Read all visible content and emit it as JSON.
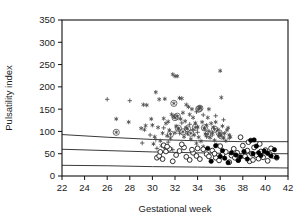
{
  "chart_data": {
    "type": "scatter",
    "title": "",
    "subtitle": "",
    "xlabel": "Gestational week",
    "ylabel": "Pulsatility index",
    "xlim": [
      22,
      42
    ],
    "ylim": [
      0,
      350
    ],
    "xticks": [
      22,
      24,
      26,
      28,
      30,
      32,
      34,
      36,
      38,
      40,
      42
    ],
    "yticks": [
      0,
      50,
      100,
      150,
      200,
      250,
      300,
      350
    ],
    "grid": false,
    "legend_position": "none",
    "background_color": "#ffffff",
    "axis_color": "#111111",
    "marker_color": "#4a4a4a",
    "curve_color": "#3a3a3a",
    "annotations": [],
    "series": [
      {
        "name": "asterisk",
        "marker": "asterisk",
        "points": [
          [
            26.8,
            128
          ],
          [
            27.9,
            121
          ],
          [
            29.2,
            160
          ],
          [
            29.5,
            159
          ],
          [
            29.9,
            128
          ],
          [
            30.3,
            188
          ],
          [
            30.6,
            172
          ],
          [
            31.1,
            173
          ],
          [
            31.4,
            122
          ],
          [
            31.8,
            228
          ],
          [
            32.0,
            224
          ],
          [
            32.2,
            224
          ],
          [
            32.4,
            175
          ],
          [
            32.6,
            174
          ],
          [
            33.2,
            155
          ],
          [
            33.5,
            150
          ],
          [
            34.2,
            154
          ],
          [
            35.0,
            150
          ],
          [
            36.0,
            236
          ],
          [
            36.1,
            176
          ],
          [
            29.0,
            107
          ],
          [
            29.3,
            104
          ],
          [
            29.4,
            113
          ],
          [
            30.0,
            114
          ],
          [
            30.5,
            109
          ],
          [
            30.9,
            96
          ],
          [
            31.0,
            129
          ],
          [
            31.2,
            118
          ],
          [
            31.5,
            103
          ],
          [
            31.7,
            138
          ],
          [
            31.9,
            133
          ],
          [
            32.1,
            112
          ],
          [
            32.3,
            105
          ],
          [
            32.5,
            128
          ],
          [
            32.7,
            142
          ],
          [
            32.9,
            123
          ],
          [
            33.0,
            108
          ],
          [
            33.3,
            138
          ],
          [
            33.6,
            131
          ],
          [
            33.8,
            119
          ],
          [
            34.0,
            110
          ],
          [
            34.4,
            121
          ],
          [
            34.6,
            106
          ],
          [
            34.8,
            114
          ],
          [
            35.2,
            118
          ],
          [
            35.4,
            109
          ],
          [
            35.6,
            121
          ],
          [
            35.8,
            104
          ],
          [
            36.2,
            112
          ],
          [
            36.4,
            96
          ],
          [
            36.6,
            103
          ],
          [
            36.8,
            92
          ],
          [
            30.2,
            88
          ],
          [
            30.7,
            79
          ],
          [
            31.3,
            90
          ],
          [
            31.6,
            84
          ],
          [
            32.8,
            88
          ],
          [
            33.1,
            95
          ],
          [
            33.4,
            83
          ],
          [
            33.7,
            92
          ],
          [
            34.1,
            87
          ],
          [
            34.3,
            78
          ],
          [
            34.7,
            94
          ],
          [
            35.1,
            86
          ],
          [
            35.3,
            97
          ],
          [
            35.5,
            80
          ],
          [
            35.9,
            90
          ],
          [
            36.3,
            85
          ],
          [
            36.5,
            79
          ],
          [
            36.9,
            88
          ],
          [
            30.1,
            72
          ],
          [
            30.8,
            68
          ],
          [
            31.1,
            63
          ],
          [
            33.9,
            73
          ],
          [
            34.5,
            66
          ],
          [
            35.7,
            70
          ],
          [
            32.0,
            97
          ],
          [
            33.0,
            160
          ],
          [
            34.9,
            131
          ],
          [
            36.7,
            108
          ]
        ]
      },
      {
        "name": "plus",
        "marker": "plus",
        "points": [
          [
            26.0,
            172
          ],
          [
            28.0,
            169
          ],
          [
            29.1,
            74
          ],
          [
            30.4,
            62
          ],
          [
            31.8,
            59
          ],
          [
            33.9,
            144
          ],
          [
            34.5,
            137
          ],
          [
            35.6,
            135
          ],
          [
            36.3,
            126
          ],
          [
            33.3,
            116
          ],
          [
            34.0,
            98
          ],
          [
            35.0,
            101
          ],
          [
            29.8,
            92
          ],
          [
            30.3,
            82
          ],
          [
            31.4,
            76
          ],
          [
            32.6,
            119
          ],
          [
            33.6,
            104
          ],
          [
            35.3,
            92
          ],
          [
            36.0,
            94
          ],
          [
            36.8,
            85
          ],
          [
            31.0,
            108
          ],
          [
            32.4,
            96
          ],
          [
            34.8,
            88
          ]
        ]
      },
      {
        "name": "circled-asterisk",
        "marker": "circled-asterisk",
        "points": [
          [
            26.8,
            98
          ],
          [
            31.9,
            163
          ],
          [
            32.2,
            134
          ],
          [
            32.0,
            131
          ],
          [
            34.2,
            152
          ],
          [
            34.1,
            150
          ],
          [
            32.3,
            107
          ],
          [
            33.1,
            106
          ],
          [
            33.8,
            109
          ],
          [
            34.6,
            108
          ],
          [
            35.5,
            105
          ],
          [
            32.7,
            99
          ],
          [
            33.4,
            96
          ],
          [
            34.9,
            94
          ],
          [
            35.9,
            97
          ],
          [
            31.6,
            94
          ],
          [
            36.1,
            90
          ]
        ]
      },
      {
        "name": "open-circle",
        "marker": "open-circle",
        "points": [
          [
            30.4,
            41
          ],
          [
            30.6,
            45
          ],
          [
            30.9,
            38
          ],
          [
            31.2,
            55
          ],
          [
            31.5,
            61
          ],
          [
            31.8,
            33
          ],
          [
            32.1,
            47
          ],
          [
            32.4,
            56
          ],
          [
            32.8,
            64
          ],
          [
            33.0,
            43
          ],
          [
            33.3,
            36
          ],
          [
            33.6,
            52
          ],
          [
            33.9,
            45
          ],
          [
            34.2,
            38
          ],
          [
            34.5,
            60
          ],
          [
            34.8,
            49
          ],
          [
            35.0,
            44
          ],
          [
            35.3,
            57
          ],
          [
            35.6,
            41
          ],
          [
            35.9,
            35
          ],
          [
            36.2,
            48
          ],
          [
            36.5,
            54
          ],
          [
            36.8,
            31
          ],
          [
            37.0,
            46
          ],
          [
            37.2,
            61
          ],
          [
            37.5,
            52
          ],
          [
            37.8,
            87
          ],
          [
            38.0,
            68
          ],
          [
            38.2,
            44
          ],
          [
            38.4,
            57
          ],
          [
            38.6,
            33
          ],
          [
            38.8,
            50
          ],
          [
            39.0,
            64
          ],
          [
            39.2,
            47
          ],
          [
            39.4,
            39
          ],
          [
            39.6,
            55
          ],
          [
            39.8,
            42
          ],
          [
            40.0,
            58
          ],
          [
            40.2,
            34
          ],
          [
            40.4,
            49
          ],
          [
            40.7,
            45
          ],
          [
            41.0,
            41
          ],
          [
            31.0,
            69
          ],
          [
            31.3,
            66
          ],
          [
            32.6,
            71
          ],
          [
            34.0,
            62
          ],
          [
            36.0,
            67
          ],
          [
            37.6,
            36
          ],
          [
            38.5,
            76
          ],
          [
            39.5,
            72
          ],
          [
            30.7,
            54
          ],
          [
            33.5,
            59
          ],
          [
            35.5,
            50
          ],
          [
            37.3,
            41
          ],
          [
            38.9,
            36
          ],
          [
            40.5,
            62
          ]
        ]
      },
      {
        "name": "filled-circle",
        "marker": "filled-circle",
        "points": [
          [
            35.2,
            33
          ],
          [
            35.6,
            68
          ],
          [
            36.0,
            44
          ],
          [
            36.4,
            40
          ],
          [
            36.7,
            30
          ],
          [
            37.0,
            52
          ],
          [
            37.4,
            47
          ],
          [
            37.8,
            43
          ],
          [
            38.1,
            55
          ],
          [
            38.4,
            38
          ],
          [
            38.7,
            80
          ],
          [
            39.0,
            81
          ],
          [
            39.2,
            67
          ],
          [
            39.4,
            52
          ],
          [
            39.6,
            46
          ],
          [
            39.9,
            56
          ],
          [
            40.2,
            51
          ],
          [
            40.5,
            45
          ],
          [
            40.8,
            59
          ],
          [
            41.0,
            42
          ],
          [
            34.9,
            62
          ],
          [
            36.2,
            57
          ],
          [
            37.6,
            35
          ],
          [
            38.9,
            50
          ]
        ]
      }
    ],
    "reference_curves": [
      {
        "name": "upper-reference-curve",
        "points": [
          [
            22,
            93
          ],
          [
            26,
            87
          ],
          [
            30,
            82
          ],
          [
            34,
            79
          ],
          [
            38,
            77
          ],
          [
            42,
            77
          ]
        ]
      },
      {
        "name": "middle-reference-curve",
        "points": [
          [
            22,
            60
          ],
          [
            26,
            57
          ],
          [
            30,
            54
          ],
          [
            34,
            52
          ],
          [
            38,
            50
          ],
          [
            42,
            50
          ]
        ]
      },
      {
        "name": "lower-reference-curve",
        "points": [
          [
            22,
            24
          ],
          [
            26,
            23
          ],
          [
            30,
            21
          ],
          [
            34,
            20
          ],
          [
            38,
            19
          ],
          [
            42,
            18
          ]
        ]
      }
    ]
  }
}
